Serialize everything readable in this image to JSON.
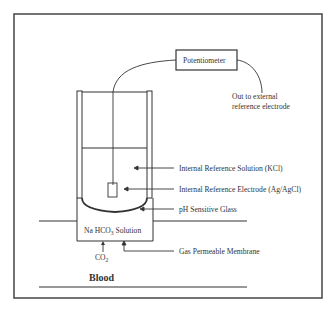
{
  "diagram": {
    "potentiometer_label": "Potentiometer",
    "external_ref_label_line1": "Out to external",
    "external_ref_label_line2": "reference electrode",
    "labels": {
      "internal_solution": "Internal Reference Solution (KCl)",
      "internal_electrode": "Internal Reference Electrode (Ag/AgCl)",
      "ph_glass": "pH Sensitive Glass",
      "membrane": "Gas Permeable Membrane"
    },
    "solution_label_prefix": "Na HCO",
    "solution_label_sub": "3",
    "solution_label_suffix": " Solution",
    "co2_label": "CO",
    "co2_sub": "2",
    "blood_label": "Blood"
  },
  "colors": {
    "line": "#333333",
    "frame": "#444444",
    "background": "#ffffff"
  }
}
